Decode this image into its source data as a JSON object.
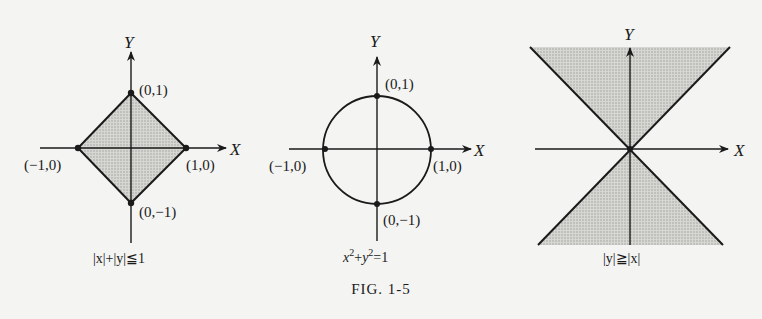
{
  "figure_label": "FIG. 1-5",
  "panels": [
    {
      "id": "diamond",
      "caption": "|x|+|y|≦1",
      "axes": {
        "x": "X",
        "y": "Y"
      },
      "points": [
        "(0,1)",
        "(1,0)",
        "(0,−1)",
        "(−1,0)"
      ],
      "shaded": "interior of diamond"
    },
    {
      "id": "circle",
      "caption_base_x": "x",
      "caption_plus": "+",
      "caption_base_y": "y",
      "caption_exp": "2",
      "caption_rhs": "=1",
      "axes": {
        "x": "X",
        "y": "Y"
      },
      "points": [
        "(0,1)",
        "(1,0)",
        "(0,−1)",
        "(−1,0)"
      ]
    },
    {
      "id": "double-cone",
      "caption": "|y|≧|x|",
      "axes": {
        "x": "X",
        "y": "Y"
      },
      "shaded": "top and bottom wedges"
    }
  ],
  "colors": {
    "ink": "#1a1a1a",
    "shade": "#c9c9c6",
    "paper": "#f4f4f2"
  }
}
